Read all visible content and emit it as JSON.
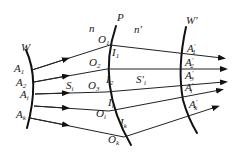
{
  "diagram": {
    "type": "optical refraction wavefront diagram",
    "surfaces": {
      "incident_wavefront": {
        "label": "W"
      },
      "refracting_surface": {
        "label": "P"
      },
      "refracted_wavefront": {
        "label": "W",
        "prime": "′"
      }
    },
    "media": {
      "left": {
        "label": "n"
      },
      "right": {
        "label": "n",
        "prime": "′"
      }
    },
    "incident_points": [
      {
        "base": "A",
        "sub": "1"
      },
      {
        "base": "A",
        "sub": "2"
      },
      {
        "base": "A",
        "sub": "i"
      },
      {
        "base": "A",
        "sub": "k"
      }
    ],
    "surface_points": [
      {
        "base": "O",
        "sub": "1"
      },
      {
        "base": "O",
        "sub": "2"
      },
      {
        "base": "O",
        "sub": "3"
      },
      {
        "base": "O",
        "sub": "i"
      },
      {
        "base": "O",
        "sub": "k"
      }
    ],
    "intersection_points": [
      {
        "base": "I",
        "sub": "1"
      },
      {
        "base": "I",
        "sub": "2"
      },
      {
        "base": "I",
        "sub": "i"
      },
      {
        "base": "I",
        "sub": "k"
      }
    ],
    "refracted_points": [
      {
        "base": "A",
        "prime": "′",
        "sub": "1"
      },
      {
        "base": "A",
        "prime": "′",
        "sub": "2"
      },
      {
        "base": "A",
        "prime": "′",
        "sub": "3"
      },
      {
        "base": "A",
        "prime": "′",
        "sub": "i"
      },
      {
        "base": "A",
        "prime": "′",
        "sub": "k"
      }
    ],
    "path_labels": {
      "incident": {
        "base": "S",
        "sub": "i"
      },
      "refracted": {
        "base": "S",
        "prime": "′",
        "sub": "i"
      }
    }
  }
}
